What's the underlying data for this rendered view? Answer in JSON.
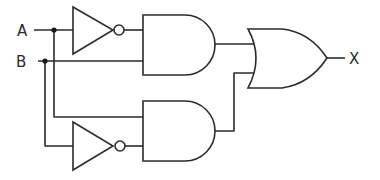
{
  "diagram": {
    "type": "logic-circuit",
    "inputs": [
      {
        "id": "A",
        "label": "A"
      },
      {
        "id": "B",
        "label": "B"
      }
    ],
    "outputs": [
      {
        "id": "X",
        "label": "X"
      }
    ],
    "gates": [
      {
        "id": "not1",
        "type": "NOT",
        "input": "A"
      },
      {
        "id": "and1",
        "type": "AND",
        "inputs": [
          "not1",
          "B"
        ]
      },
      {
        "id": "not2",
        "type": "NOT",
        "input": "B"
      },
      {
        "id": "and2",
        "type": "AND",
        "inputs": [
          "A",
          "not2"
        ]
      },
      {
        "id": "or1",
        "type": "OR",
        "inputs": [
          "and1",
          "and2"
        ],
        "output": "X"
      }
    ],
    "expression": "X = (¬A ∧ B) ∨ (A ∧ ¬B)",
    "colors": {
      "stroke": "#2b2b2b",
      "background": "#ffffff"
    }
  }
}
